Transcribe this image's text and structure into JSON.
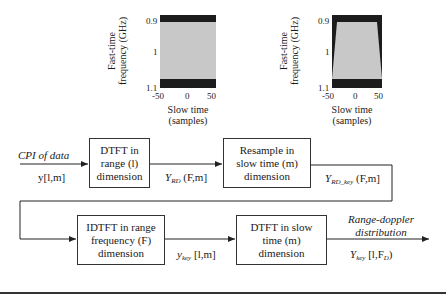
{
  "plots": {
    "left": {
      "ylabel_line1": "Fast-time",
      "ylabel_line2": "frequency (GHz)",
      "yticks": [
        "0.9",
        "1",
        "1.1"
      ],
      "xticks": [
        "-50",
        "0",
        "50"
      ],
      "xlabel_line1": "Slow time",
      "xlabel_line2": "(samples)",
      "shape": "rectangle"
    },
    "right": {
      "ylabel_line1": "Fast-time",
      "ylabel_line2": "frequency (GHz)",
      "yticks": [
        "0.9",
        "1",
        "1.1"
      ],
      "xticks": [
        "-50",
        "0",
        "50"
      ],
      "xlabel_line1": "Slow time",
      "xlabel_line2": "(samples)",
      "shape": "trapezoid"
    }
  },
  "flow": {
    "input": {
      "title": "CPI of data",
      "signal": "y[l,m]"
    },
    "blocks": [
      {
        "line1": "DTFT in",
        "line2": "range (l)",
        "line3": "dimension"
      },
      {
        "line1": "Resample in",
        "line2": "slow time (m)",
        "line3": "dimension"
      },
      {
        "line1": "IDTFT in range",
        "line2": "frequency (F)",
        "line3": "dimension"
      },
      {
        "line1": "DTFT in slow",
        "line2": "time (m)",
        "line3": "dimension"
      }
    ],
    "signals": {
      "s1_base": "Y",
      "s1_sub": "RD",
      "s1_args": " (F,m]",
      "s2_base": "Y",
      "s2_sub": "RD_key",
      "s2_args": " (F,m]",
      "s3_base": "y",
      "s3_sub": "key",
      "s3_args": " [l,m]",
      "s4_base": "Y",
      "s4_sub": "key",
      "s4_args": " [l,F",
      "s4_sub2": "D",
      "s4_end": ")"
    },
    "output": {
      "line1": "Range-doppler",
      "line2": "distribution"
    }
  },
  "colors": {
    "line": "#222222",
    "plot_dark": "#1c1c1c",
    "plot_light": "#c8c8c8"
  }
}
